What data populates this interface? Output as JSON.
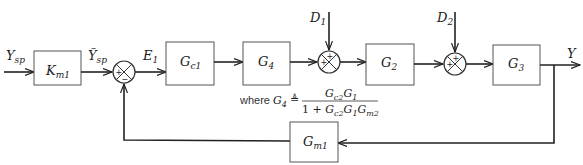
{
  "diagram": {
    "type": "block-diagram",
    "title": "",
    "signals": {
      "input": {
        "base": "Y",
        "sub": "sp"
      },
      "scaled_input": {
        "base": "Ỹ",
        "sub": "sp"
      },
      "error": {
        "base": "E",
        "sub": "1"
      },
      "disturbance1": {
        "base": "D",
        "sub": "1"
      },
      "disturbance2": {
        "base": "D",
        "sub": "2"
      },
      "output": {
        "base": "Y",
        "sub": ""
      }
    },
    "blocks": {
      "km1": {
        "base": "K",
        "sub": "m1"
      },
      "gc1": {
        "base": "G",
        "sub": "c1"
      },
      "g4": {
        "base": "G",
        "sub": "4"
      },
      "g2": {
        "base": "G",
        "sub": "2"
      },
      "g3": {
        "base": "G",
        "sub": "3"
      },
      "gm1": {
        "base": "G",
        "sub": "m1"
      }
    },
    "summing_junctions": {
      "sum1": {
        "top": "",
        "left": "+",
        "bottom": "−"
      },
      "sum2": {
        "top": "+",
        "left": "+"
      },
      "sum3": {
        "top": "+",
        "left": "+"
      }
    },
    "note": {
      "prefix": "where",
      "lhs_base": "G",
      "lhs_sub": "4",
      "defeq": "≜",
      "numerator": [
        {
          "b": "G",
          "s": "c2"
        },
        {
          "b": "G",
          "s": "1"
        }
      ],
      "denominator_prefix": "1 + ",
      "denominator": [
        {
          "b": "G",
          "s": "c2"
        },
        {
          "b": "G",
          "s": "1"
        },
        {
          "b": "G",
          "s": "m2"
        }
      ]
    },
    "colors": {
      "line": "#222222",
      "box_border": "#555555",
      "background": "#ffffff"
    }
  }
}
